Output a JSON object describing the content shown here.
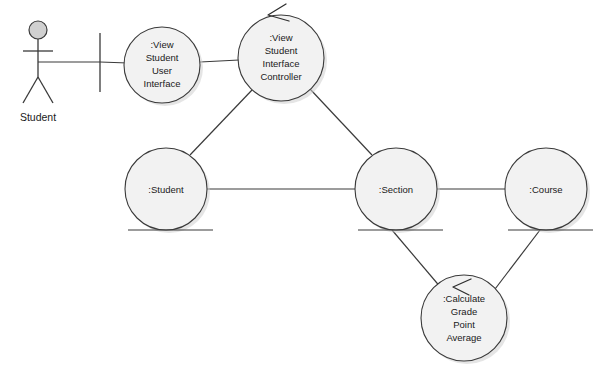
{
  "diagram": {
    "type": "uml-communication-diagram",
    "background_color": "#ffffff",
    "line_color": "#3a3a3a",
    "node_fill_color": "#f2f2f2",
    "actor": {
      "name": "Student",
      "label": "Student",
      "head_fill": "#d0d0d0"
    },
    "boundary_bar": {
      "label": ""
    },
    "nodes": [
      {
        "id": "view-student-user-interface",
        "lines": [
          ":View",
          "Student",
          "User",
          "Interface"
        ],
        "cx": 162,
        "cy": 65,
        "r": 38,
        "underline": false,
        "arrow": false
      },
      {
        "id": "view-student-interface-controller",
        "lines": [
          ":View",
          "Student",
          "Interface",
          "Controller"
        ],
        "cx": 281,
        "cy": 58,
        "r": 43,
        "underline": false,
        "arrow": true
      },
      {
        "id": "student",
        "lines": [
          ":Student"
        ],
        "cx": 166,
        "cy": 189,
        "r": 41,
        "underline": true,
        "arrow": false
      },
      {
        "id": "section",
        "lines": [
          ":Section"
        ],
        "cx": 396,
        "cy": 189,
        "r": 41,
        "underline": true,
        "arrow": false
      },
      {
        "id": "course",
        "lines": [
          ":Course"
        ],
        "cx": 546,
        "cy": 189,
        "r": 41,
        "underline": true,
        "arrow": false
      },
      {
        "id": "calculate-grade-point-average",
        "lines": [
          ":Calculate",
          "Grade",
          "Point",
          "Average"
        ],
        "cx": 464,
        "cy": 318,
        "r": 43,
        "underline": false,
        "arrow": true
      }
    ],
    "links": [
      {
        "id": "actor-to-boundary",
        "from": "actor",
        "to": "boundary-bar"
      },
      {
        "id": "boundary-to-vsui",
        "from": "boundary-bar",
        "to": "view-student-user-interface"
      },
      {
        "id": "vsui-to-vsic",
        "from": "view-student-user-interface",
        "to": "view-student-interface-controller"
      },
      {
        "id": "vsic-to-student",
        "from": "view-student-interface-controller",
        "to": "student"
      },
      {
        "id": "vsic-to-section",
        "from": "view-student-interface-controller",
        "to": "section"
      },
      {
        "id": "student-to-section",
        "from": "student",
        "to": "section"
      },
      {
        "id": "section-to-course",
        "from": "section",
        "to": "course"
      },
      {
        "id": "section-to-gpa",
        "from": "section",
        "to": "calculate-grade-point-average"
      },
      {
        "id": "course-to-gpa",
        "from": "course",
        "to": "calculate-grade-point-average"
      }
    ]
  }
}
